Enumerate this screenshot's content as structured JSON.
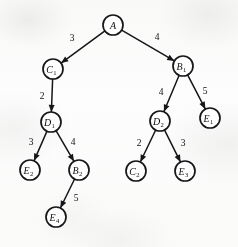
{
  "figure": {
    "background_color": "#fdfdfd",
    "ink_color": "#16161a",
    "width": 238,
    "height": 247
  },
  "chart_data": {
    "type": "diagram",
    "diagram_kind": "weighted-directed-tree",
    "directed": true,
    "node_radius": 10,
    "nodes": [
      {
        "id": "A",
        "base": "A",
        "subscript": "",
        "x": 113,
        "y": 25,
        "r": 10.0
      },
      {
        "id": "C1",
        "base": "C",
        "subscript": "1",
        "x": 53,
        "y": 69,
        "r": 10.0
      },
      {
        "id": "B1",
        "base": "B",
        "subscript": "1",
        "x": 183,
        "y": 66,
        "r": 10.0
      },
      {
        "id": "D1",
        "base": "D",
        "subscript": "1",
        "x": 51,
        "y": 122,
        "r": 10.0
      },
      {
        "id": "D2",
        "base": "D",
        "subscript": "2",
        "x": 160,
        "y": 121,
        "r": 10.0
      },
      {
        "id": "E1",
        "base": "E",
        "subscript": "1",
        "x": 210,
        "y": 118,
        "r": 10.0
      },
      {
        "id": "E2",
        "base": "E",
        "subscript": "2",
        "x": 30,
        "y": 170,
        "r": 10.0
      },
      {
        "id": "B2",
        "base": "B",
        "subscript": "2",
        "x": 79,
        "y": 170,
        "r": 10.0
      },
      {
        "id": "C2",
        "base": "C",
        "subscript": "2",
        "x": 136,
        "y": 171,
        "r": 10.0
      },
      {
        "id": "E3",
        "base": "E",
        "subscript": "3",
        "x": 185,
        "y": 171,
        "r": 10.0
      },
      {
        "id": "E4",
        "base": "E",
        "subscript": "4",
        "x": 56,
        "y": 217,
        "r": 10.0
      }
    ],
    "edges": [
      {
        "from": "A",
        "to": "C1",
        "weight": 3,
        "label_x": 72,
        "label_y": 38
      },
      {
        "from": "A",
        "to": "B1",
        "weight": 4,
        "label_x": 157,
        "label_y": 37
      },
      {
        "from": "C1",
        "to": "D1",
        "weight": 2,
        "label_x": 42,
        "label_y": 96
      },
      {
        "from": "B1",
        "to": "D2",
        "weight": 4,
        "label_x": 161,
        "label_y": 92
      },
      {
        "from": "B1",
        "to": "E1",
        "weight": 5,
        "label_x": 205,
        "label_y": 91
      },
      {
        "from": "D1",
        "to": "E2",
        "weight": 3,
        "label_x": 31,
        "label_y": 142
      },
      {
        "from": "D1",
        "to": "B2",
        "weight": 4,
        "label_x": 73,
        "label_y": 142
      },
      {
        "from": "D2",
        "to": "C2",
        "weight": 2,
        "label_x": 139,
        "label_y": 143
      },
      {
        "from": "D2",
        "to": "E3",
        "weight": 3,
        "label_x": 183,
        "label_y": 143
      },
      {
        "from": "B2",
        "to": "E4",
        "weight": 5,
        "label_x": 76,
        "label_y": 198
      }
    ],
    "node_labels": [
      "A",
      "C1",
      "B1",
      "D1",
      "D2",
      "E1",
      "E2",
      "B2",
      "C2",
      "E3",
      "E4"
    ],
    "edge_weights": [
      3,
      4,
      2,
      4,
      5,
      3,
      4,
      2,
      3,
      5
    ]
  }
}
